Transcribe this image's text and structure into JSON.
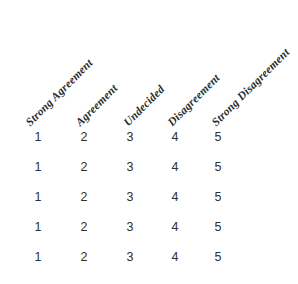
{
  "document": {
    "kind": "likert-scale-response-grid",
    "background_color": "#ffffff",
    "header_text_color": "#2b2b2b",
    "body_text_color": "#2f2f2f",
    "header_rotation_degrees": "-45"
  },
  "columns": [
    {
      "label": "Strong Agreement",
      "value": "1",
      "x": 38,
      "header_x": 32
    },
    {
      "label": "Agreement",
      "value": "2",
      "x": 84,
      "header_x": 82
    },
    {
      "label": "Undecided",
      "value": "3",
      "x": 130,
      "header_x": 130
    },
    {
      "label": "Disagreement",
      "value": "4",
      "x": 175,
      "header_x": 174
    },
    {
      "label": "Strong Disagreement",
      "value": "5",
      "x": 218,
      "header_x": 218
    }
  ],
  "rows": [
    {
      "values": [
        "1",
        "2",
        "3",
        "4",
        "5"
      ]
    },
    {
      "values": [
        "1",
        "2",
        "3",
        "4",
        "5"
      ]
    },
    {
      "values": [
        "1",
        "2",
        "3",
        "4",
        "5"
      ]
    },
    {
      "values": [
        "1",
        "2",
        "3",
        "4",
        "5"
      ]
    },
    {
      "values": [
        "1",
        "2",
        "3",
        "4",
        "5"
      ]
    }
  ]
}
